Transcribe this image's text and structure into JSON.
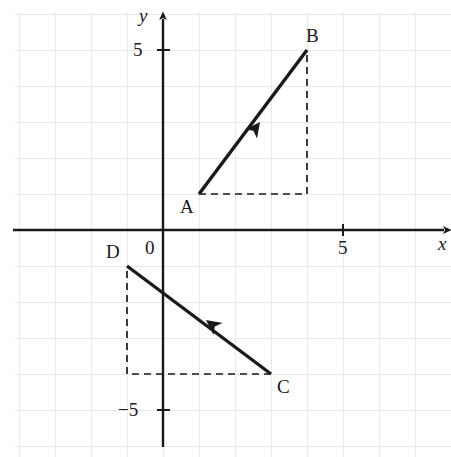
{
  "figure": {
    "type": "coordinate-plane-vector-diagram",
    "background_color": "#ffffff",
    "grid_color": "#e8e8e8",
    "axis_color": "#1a1a1a",
    "vector_color": "#1a1a1a",
    "dash_color": "#1a1a1a"
  },
  "axes": {
    "x_label": "x",
    "y_label": "y",
    "origin_label": "0",
    "x_ticks": [
      {
        "label": "5",
        "value": 5
      }
    ],
    "y_ticks": [
      {
        "label": "5",
        "value": 5
      },
      {
        "label": "−5",
        "value": -5
      }
    ],
    "x_range": [
      -4.1,
      8.0
    ],
    "y_range": [
      -6.3,
      6.0
    ],
    "units_per_grid": 1,
    "pixels_per_unit": 36,
    "origin_px": {
      "x": 163,
      "y": 230
    }
  },
  "points": {
    "A": {
      "label": "A",
      "x": 1,
      "y": 1
    },
    "B": {
      "label": "B",
      "x": 4,
      "y": 5
    },
    "C": {
      "label": "C",
      "x": 3,
      "y": -4
    },
    "D": {
      "label": "D",
      "x": -1,
      "y": -1
    }
  },
  "vectors": [
    {
      "name": "AB",
      "from": "A",
      "to": "B",
      "from_x": 1,
      "from_y": 1,
      "to_x": 4,
      "to_y": 5,
      "components": {
        "dx": 3,
        "dy": 4
      },
      "arrow_at": "midpoint",
      "arrow_direction": "up-right"
    },
    {
      "name": "CD",
      "from": "C",
      "to": "D",
      "from_x": 3,
      "from_y": -4,
      "to_x": -1,
      "to_y": -1,
      "components": {
        "dx": -4,
        "dy": 3
      },
      "arrow_at": "midpoint",
      "arrow_direction": "up-left"
    }
  ],
  "dashed_triangles": [
    {
      "name": "AB-components",
      "corner_x": 4,
      "corner_y": 1,
      "legs": [
        {
          "from_x": 1,
          "from_y": 1,
          "to_x": 4,
          "to_y": 1
        },
        {
          "from_x": 4,
          "from_y": 1,
          "to_x": 4,
          "to_y": 5
        }
      ]
    },
    {
      "name": "CD-components",
      "corner_x": -1,
      "corner_y": -4,
      "legs": [
        {
          "from_x": 3,
          "from_y": -4,
          "to_x": -1,
          "to_y": -4
        },
        {
          "from_x": -1,
          "from_y": -4,
          "to_x": -1,
          "to_y": -1
        }
      ]
    }
  ],
  "chart_data": {
    "type": "scatter",
    "title": "",
    "xlabel": "x",
    "ylabel": "y",
    "xlim": [
      -4.1,
      8.0
    ],
    "ylim": [
      -6.3,
      6.0
    ],
    "grid": true,
    "legend": "none",
    "series": [
      {
        "name": "Vector AB",
        "points": [
          {
            "label": "A",
            "x": 1,
            "y": 1
          },
          {
            "label": "B",
            "x": 4,
            "y": 5
          }
        ]
      },
      {
        "name": "Vector CD",
        "points": [
          {
            "label": "C",
            "x": 3,
            "y": -4
          },
          {
            "label": "D",
            "x": -1,
            "y": -1
          }
        ]
      }
    ],
    "annotations": [
      {
        "text": "A",
        "x": 1,
        "y": 1
      },
      {
        "text": "B",
        "x": 4,
        "y": 5
      },
      {
        "text": "C",
        "x": 3,
        "y": -4
      },
      {
        "text": "D",
        "x": -1,
        "y": -1
      },
      {
        "text": "0",
        "x": 0,
        "y": 0
      },
      {
        "text": "5",
        "x": 5,
        "y": 0
      },
      {
        "text": "5",
        "x": 0,
        "y": 5
      },
      {
        "text": "−5",
        "x": 0,
        "y": -5
      }
    ]
  },
  "labels": {
    "A": "A",
    "B": "B",
    "C": "C",
    "D": "D",
    "origin": "0",
    "x_axis": "x",
    "y_axis": "y",
    "x_tick_5": "5",
    "y_tick_5": "5",
    "y_tick_neg5": "−5"
  }
}
